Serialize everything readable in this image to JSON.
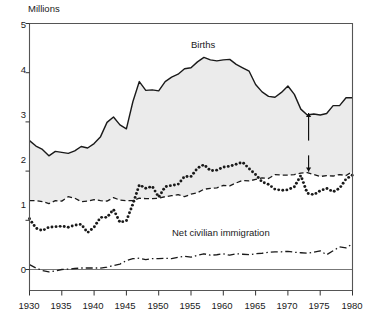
{
  "chart_data": {
    "type": "area",
    "title": "",
    "subtitle": "",
    "ylabel": "Millions",
    "xlabel": "",
    "ylim": [
      0,
      5
    ],
    "xlim": [
      1930,
      1980
    ],
    "grid": false,
    "legend_position": "inline-annotations",
    "yticks": [
      "0",
      "1",
      "2",
      "3",
      "4",
      "5"
    ],
    "ytick_values": [
      0,
      1,
      2,
      3,
      4,
      5
    ],
    "xticks": [
      "1930",
      "1935",
      "1940",
      "1945",
      "1950",
      "1955",
      "1960",
      "1965",
      "1970",
      "1975",
      "1980"
    ],
    "xtick_values": [
      1930,
      1935,
      1940,
      1945,
      1950,
      1955,
      1960,
      1965,
      1970,
      1975,
      1980
    ],
    "shaded_region": {
      "label": "Natural increase",
      "between": [
        "Births",
        "Deaths"
      ],
      "color": "#ebebeb"
    },
    "x": [
      1930,
      1931,
      1932,
      1933,
      1934,
      1935,
      1936,
      1937,
      1938,
      1939,
      1940,
      1941,
      1942,
      1943,
      1944,
      1945,
      1946,
      1947,
      1948,
      1949,
      1950,
      1951,
      1952,
      1953,
      1954,
      1955,
      1956,
      1957,
      1958,
      1959,
      1960,
      1961,
      1962,
      1963,
      1964,
      1965,
      1966,
      1967,
      1968,
      1969,
      1970,
      1971,
      1972,
      1973,
      1974,
      1975,
      1976,
      1977,
      1978,
      1979,
      1980
    ],
    "series": [
      {
        "name": "Births",
        "style": "solid-line",
        "values": [
          2.62,
          2.51,
          2.44,
          2.31,
          2.4,
          2.38,
          2.36,
          2.41,
          2.5,
          2.47,
          2.56,
          2.7,
          2.99,
          3.1,
          2.94,
          2.86,
          3.41,
          3.82,
          3.64,
          3.65,
          3.63,
          3.82,
          3.91,
          3.97,
          4.08,
          4.1,
          4.22,
          4.31,
          4.26,
          4.24,
          4.26,
          4.27,
          4.17,
          4.1,
          4.03,
          3.76,
          3.61,
          3.52,
          3.5,
          3.6,
          3.73,
          3.56,
          3.26,
          3.14,
          3.16,
          3.14,
          3.17,
          3.33,
          3.33,
          3.49,
          3.49
        ],
        "units": "millions"
      },
      {
        "name": "Deaths",
        "style": "dashed-line",
        "values": [
          1.4,
          1.4,
          1.38,
          1.34,
          1.4,
          1.39,
          1.48,
          1.45,
          1.38,
          1.39,
          1.42,
          1.4,
          1.39,
          1.46,
          1.41,
          1.4,
          1.4,
          1.45,
          1.44,
          1.44,
          1.45,
          1.48,
          1.5,
          1.52,
          1.48,
          1.53,
          1.56,
          1.63,
          1.65,
          1.66,
          1.71,
          1.7,
          1.76,
          1.81,
          1.8,
          1.83,
          1.86,
          1.85,
          1.93,
          1.92,
          1.92,
          1.93,
          1.96,
          1.97,
          1.93,
          1.89,
          1.91,
          1.9,
          1.93,
          1.91,
          1.99
        ],
        "units": "millions"
      },
      {
        "name": "Net growth",
        "style": "dotted-line",
        "values": [
          1.03,
          0.84,
          0.79,
          0.86,
          0.87,
          0.88,
          0.86,
          0.9,
          0.92,
          0.75,
          0.86,
          1.06,
          1.06,
          1.22,
          0.96,
          0.99,
          1.33,
          1.72,
          1.65,
          1.69,
          1.47,
          1.68,
          1.71,
          1.73,
          1.89,
          1.89,
          2.06,
          2.13,
          2.01,
          2.02,
          2.08,
          2.1,
          2.14,
          2.18,
          2.05,
          1.93,
          1.78,
          1.73,
          1.63,
          1.61,
          1.62,
          1.68,
          1.91,
          1.55,
          1.52,
          1.6,
          1.65,
          1.58,
          1.65,
          1.84,
          1.92
        ],
        "units": "millions"
      },
      {
        "name": "Net civilian immigration",
        "style": "dash-dot-line",
        "values": [
          0.1,
          0.03,
          -0.02,
          -0.05,
          -0.03,
          0.0,
          0.01,
          0.02,
          0.03,
          0.03,
          0.03,
          0.03,
          0.05,
          0.08,
          0.11,
          0.18,
          0.22,
          0.23,
          0.2,
          0.22,
          0.22,
          0.23,
          0.22,
          0.25,
          0.27,
          0.25,
          0.29,
          0.32,
          0.29,
          0.3,
          0.32,
          0.29,
          0.32,
          0.31,
          0.3,
          0.32,
          0.33,
          0.35,
          0.36,
          0.36,
          0.37,
          0.35,
          0.34,
          0.33,
          0.35,
          0.38,
          0.3,
          0.38,
          0.46,
          0.44,
          0.52
        ],
        "units": "millions"
      }
    ],
    "annotations": [
      {
        "name": "births-label",
        "text": "Births",
        "x": 1960.5,
        "y": 4.62
      },
      {
        "name": "net-growth-label",
        "text": "Net growth",
        "x": 1955.5,
        "y": 2.95
      },
      {
        "name": "deaths-label",
        "text": "Deaths",
        "x": 1954.0,
        "y": 2.12
      },
      {
        "name": "natural-increase-label",
        "text": "Natural increase",
        "x": 1968.0,
        "y": 2.48
      },
      {
        "name": "net-civilian-immigration-label",
        "text": "Net civilian immigration",
        "x": 1953.0,
        "y": 1.07
      }
    ],
    "colors": {
      "line": "#1a1a1a",
      "fill": "#ebebeb",
      "axis": "#555555",
      "background": "#ffffff"
    }
  }
}
